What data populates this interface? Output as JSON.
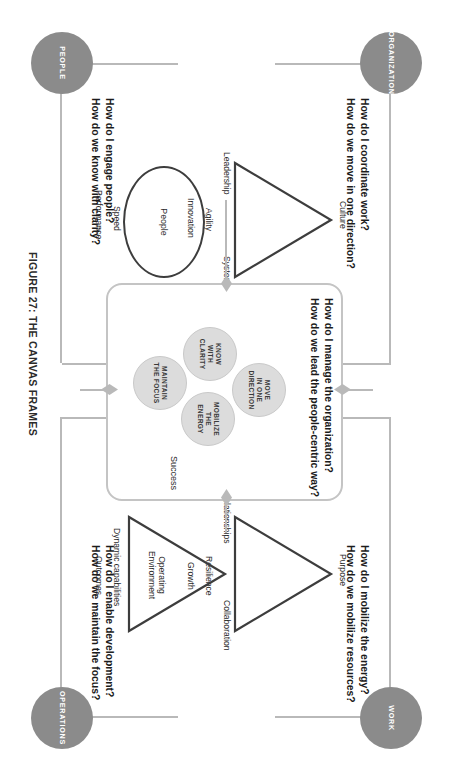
{
  "figure": {
    "caption": "FIGURE 27: THE CANVAS FRAMES",
    "accent_gray": "#8b8b8b",
    "frame_gray": "#b9b9b9",
    "bubble_gray": "#dcdcdc",
    "stroke_dark": "#3d3d3d"
  },
  "quadrants": {
    "organization": {
      "node_label": "ORGANIZATION",
      "question_line1": "How do I coordinate work?",
      "question_line2": "How do we move in one direction?",
      "shape": "triangle",
      "apex_label": "Culture",
      "side_label_left": "Leadership",
      "side_label_right": "Systems",
      "outer_label_1": "Agility",
      "outer_label_2": "Innovation"
    },
    "work": {
      "node_label": "WORK",
      "question_line1": "How do I mobilize the energy?",
      "question_line2": "How do we mobilize resources?",
      "shape": "triangle",
      "apex_label": "Purpose",
      "side_label_left": "Relationships",
      "side_label_right": "Collaboration",
      "outer_label_1": "Resilience",
      "outer_label_2": "Growth"
    },
    "people": {
      "node_label": "PEOPLE",
      "question_line1": "How do I engage people?",
      "question_line2": "How do we know with clarity?",
      "shape": "circle",
      "center_label": "People",
      "outer_label_1": "Speed",
      "outer_label_2": "Performance"
    },
    "operations": {
      "node_label": "OPERATIONS",
      "question_line1": "How do I enable development?",
      "question_line2": "How do we maintain the focus?",
      "shape": "triangle",
      "center_label_line1": "Operating",
      "center_label_line2": "Environment",
      "outer_label_1": "Dynamic capabilities",
      "outer_label_2": "Outcomes"
    },
    "management": {
      "node_label": "MANAGEMENT"
    }
  },
  "centre": {
    "question_line1": "How do I manage the organization?",
    "question_line2": "How do we lead the people-centric way?",
    "success_label": "Success",
    "bubbles": [
      {
        "id": "move",
        "line1": "MOVE",
        "line2": "IN ONE",
        "line3": "DIRECTION"
      },
      {
        "id": "know",
        "line1": "KNOW",
        "line2": "WITH",
        "line3": "CLARITY"
      },
      {
        "id": "mobilize",
        "line1": "MOBILIZE",
        "line2": "THE",
        "line3": "ENERGY"
      },
      {
        "id": "maintain",
        "line1": "MAINTAIN",
        "line2": "THE FOCUS",
        "line3": ""
      }
    ]
  }
}
